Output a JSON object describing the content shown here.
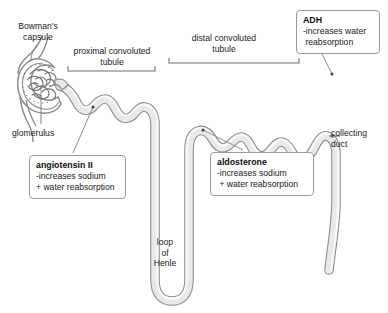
{
  "diagram": {
    "colors": {
      "tubule_fill": "#e9e9e9",
      "tubule_stroke": "#8e8e8e",
      "tubule_inner_highlight": "#ffffff",
      "label_text": "#1a1a1a",
      "box_border": "#9a9a9a",
      "leader_line": "#8a8a8a",
      "bracket": "#6f6f6f",
      "background": "#ffffff"
    },
    "structure_labels": [
      {
        "id": "bowmans-capsule",
        "text": "Bowman's\ncapsule",
        "x": 14,
        "y": 21
      },
      {
        "id": "proximal-convoluted-tubule",
        "text": "proximal convoluted\ntubule",
        "x": 68,
        "y": 46
      },
      {
        "id": "distal-convoluted-tubule",
        "text": "distal convoluted\ntubule",
        "x": 176,
        "y": 33
      },
      {
        "id": "glomerulus",
        "text": "glomerulus",
        "x": 12,
        "y": 128
      },
      {
        "id": "loop-of-henle",
        "text": "loop\nof\nHenle",
        "x": 143,
        "y": 237
      },
      {
        "id": "collecting-duct",
        "text": "collecting\nduct",
        "x": 331,
        "y": 128
      }
    ],
    "callouts": [
      {
        "id": "adh",
        "title": "ADH",
        "lines": [
          "-increases water",
          " reabsorption"
        ],
        "x": 296,
        "y": 10,
        "w": 84,
        "h": 44
      },
      {
        "id": "angiotensin-ii",
        "title": "angiotensin II",
        "lines": [
          "-increases sodium",
          "+ water reabsorption"
        ],
        "x": 29,
        "y": 155,
        "w": 97,
        "h": 45
      },
      {
        "id": "aldosterone",
        "title": "aldosterone",
        "lines": [
          "-increases sodium",
          " + water reabsorption"
        ],
        "x": 210,
        "y": 152,
        "w": 104,
        "h": 45
      }
    ]
  }
}
